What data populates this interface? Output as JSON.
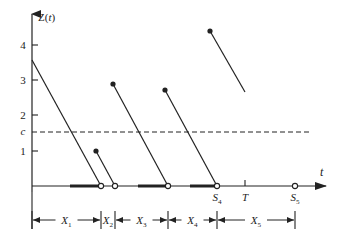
{
  "diagram": {
    "y_axis": {
      "label": "Z(t)",
      "x": 32,
      "top": 14,
      "bottom": 192
    },
    "t_axis": {
      "label": "t",
      "y": 186,
      "left": 32,
      "right": 326
    },
    "y_ticks": [
      {
        "label": "4",
        "y": 45
      },
      {
        "label": "3",
        "y": 80
      },
      {
        "label": "2",
        "y": 115
      },
      {
        "label": "1",
        "y": 151
      }
    ],
    "threshold": {
      "label": "c",
      "y": 132,
      "x_start": 32,
      "x_end": 312
    },
    "segments": [
      {
        "x1": 32,
        "y1": 60,
        "x2": 101,
        "y2": 186,
        "start_dot": false
      },
      {
        "x1": 96,
        "y1": 151,
        "x2": 115,
        "y2": 186,
        "start_dot": true
      },
      {
        "x1": 113,
        "y1": 84,
        "x2": 168,
        "y2": 186,
        "start_dot": true
      },
      {
        "x1": 165,
        "y1": 90,
        "x2": 217,
        "y2": 186,
        "start_dot": true
      },
      {
        "x1": 210,
        "y1": 31,
        "x2": 245,
        "y2": 92,
        "start_dot": true
      }
    ],
    "open_circles": [
      101,
      115,
      168,
      217,
      295
    ],
    "thick_bars": [
      [
        70,
        101
      ],
      [
        138,
        168
      ],
      [
        190,
        217
      ]
    ],
    "axis_marks": [
      {
        "label": "S4",
        "main": "S",
        "sub": "4",
        "x": 217
      },
      {
        "label": "T",
        "main": "T",
        "sub": "",
        "x": 245,
        "tick": true
      },
      {
        "label": "S5",
        "main": "S",
        "sub": "5",
        "x": 295
      }
    ],
    "intervals": {
      "y": 220,
      "boundaries": [
        32,
        101,
        115,
        168,
        217,
        295
      ],
      "labels": [
        {
          "main": "X",
          "sub": "1"
        },
        {
          "main": "X",
          "sub": "2"
        },
        {
          "main": "X",
          "sub": "3"
        },
        {
          "main": "X",
          "sub": "4"
        },
        {
          "main": "X",
          "sub": "5"
        }
      ]
    }
  }
}
